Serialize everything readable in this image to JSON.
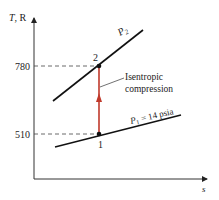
{
  "diagram": {
    "type": "T-s diagram",
    "axes": {
      "y_label_T": "T",
      "y_label_unit": ", R",
      "x_label": "s"
    },
    "ticks": {
      "t2": "780",
      "t1": "510"
    },
    "points": [
      {
        "id": "1",
        "label": "1",
        "T": 510
      },
      {
        "id": "2",
        "label": "2",
        "T": 780
      }
    ],
    "isobars": {
      "high": {
        "label_main": "P",
        "label_sub": "2"
      },
      "low": {
        "label_main": "P",
        "label_sub": "1",
        "label_rest": " = 14 psia"
      }
    },
    "process": {
      "line1": "Isentropic",
      "line2": "compression",
      "color": "#c0392b"
    }
  }
}
